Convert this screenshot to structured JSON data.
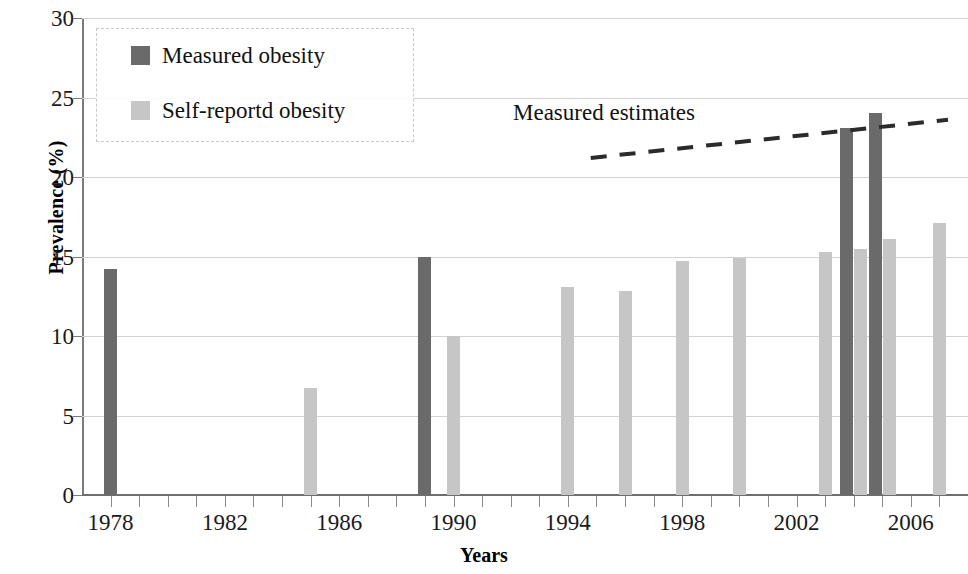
{
  "chart_data": {
    "type": "bar",
    "title": "",
    "xlabel": "Years",
    "ylabel": "Prevalence (%)",
    "ylim": [
      0,
      30
    ],
    "ytick_values": [
      0,
      5,
      10,
      15,
      20,
      25,
      30
    ],
    "ytick_labels": [
      "0",
      "5",
      "10",
      "15",
      "20",
      "25",
      "30"
    ],
    "xlim": [
      1977,
      2008
    ],
    "xtick_labels": [
      "1978",
      "1982",
      "1986",
      "1990",
      "1994",
      "1998",
      "2002",
      "2006"
    ],
    "xtick_values": [
      1978,
      1982,
      1986,
      1990,
      1994,
      1998,
      2002,
      2006
    ],
    "xtick_minor_values": [
      1978,
      1979,
      1980,
      1981,
      1982,
      1983,
      1984,
      1985,
      1986,
      1987,
      1988,
      1989,
      1990,
      1991,
      1992,
      1993,
      1994,
      1995,
      1996,
      1997,
      1998,
      1999,
      2000,
      2001,
      2002,
      2003,
      2004,
      2005,
      2006,
      2007
    ],
    "grid": "horizontal",
    "legend_position": "upper-left",
    "series": [
      {
        "name": "Measured obesity",
        "color": "#6a6a6a",
        "points": [
          {
            "x": 1978,
            "y": 14.2
          },
          {
            "x": 1989,
            "y": 15.0
          },
          {
            "x": 2004,
            "y": 23.1
          },
          {
            "x": 2005,
            "y": 24.0
          }
        ]
      },
      {
        "name": "Self-reportd obesity",
        "color": "#c6c6c6",
        "points": [
          {
            "x": 1985,
            "y": 6.7
          },
          {
            "x": 1990,
            "y": 10.0
          },
          {
            "x": 1994,
            "y": 13.1
          },
          {
            "x": 1996,
            "y": 12.8
          },
          {
            "x": 1998,
            "y": 14.7
          },
          {
            "x": 2000,
            "y": 14.9
          },
          {
            "x": 2003,
            "y": 15.3
          },
          {
            "x": 2004,
            "y": 15.5
          },
          {
            "x": 2005,
            "y": 16.1
          },
          {
            "x": 2007,
            "y": 17.1
          }
        ]
      }
    ],
    "annotations": [
      {
        "name": "measured-estimates",
        "text": "Measured estimates",
        "type": "trendline",
        "line_start": {
          "x": 1994.8,
          "y": 21.2
        },
        "line_end": {
          "x": 2007.3,
          "y": 23.6
        },
        "line_style": "dashed",
        "line_color": "#2b2b2b"
      }
    ]
  },
  "legend": {
    "items": [
      {
        "label": "Measured obesity",
        "color": "#6a6a6a"
      },
      {
        "label": "Self-reportd obesity",
        "color": "#c6c6c6"
      }
    ]
  }
}
